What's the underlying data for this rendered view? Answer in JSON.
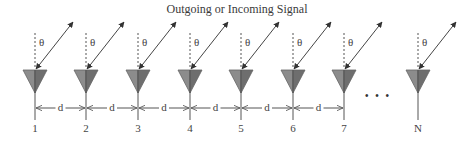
{
  "title": "Outgoing or Incoming Signal",
  "angle_label": "θ",
  "spacing_label": "d",
  "ellipsis": "• • •",
  "elements": [
    {
      "label": "1",
      "x": 35
    },
    {
      "label": "2",
      "x": 86
    },
    {
      "label": "3",
      "x": 138
    },
    {
      "label": "4",
      "x": 190
    },
    {
      "label": "5",
      "x": 241
    },
    {
      "label": "6",
      "x": 293
    },
    {
      "label": "7",
      "x": 344
    },
    {
      "label": "N",
      "x": 418
    }
  ],
  "colors": {
    "antenna_fill": "#8c8c8c",
    "antenna_dark": "#6e6e6e",
    "line": "#555555"
  }
}
